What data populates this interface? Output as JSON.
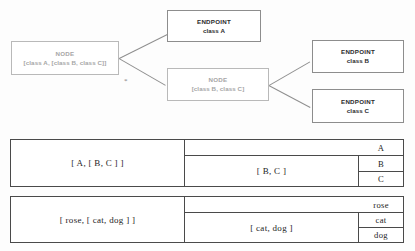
{
  "diagram": {
    "nodes": [
      {
        "id": "node-root",
        "type_label": "NODE",
        "value_label": "[class A, [class B, class C]]"
      },
      {
        "id": "node-sub",
        "type_label": "NODE",
        "value_label": "[class B, class C]"
      }
    ],
    "endpoints": [
      {
        "id": "endpoint-a",
        "type_label": "ENDPOINT",
        "value_label": "class A"
      },
      {
        "id": "endpoint-b",
        "type_label": "ENDPOINT",
        "value_label": "class B"
      },
      {
        "id": "endpoint-c",
        "type_label": "ENDPOINT",
        "value_label": "class C"
      }
    ],
    "marker": "*"
  },
  "tables": [
    {
      "id": "table-1",
      "outer": "[ A, [ B, C ] ]",
      "inner": "[ B, C ]",
      "leaves": [
        "A",
        "B",
        "C"
      ]
    },
    {
      "id": "table-2",
      "outer": "[ rose, [ cat, dog ] ]",
      "inner": "[ cat, dog ]",
      "leaves": [
        "rose",
        "cat",
        "dog"
      ]
    }
  ]
}
